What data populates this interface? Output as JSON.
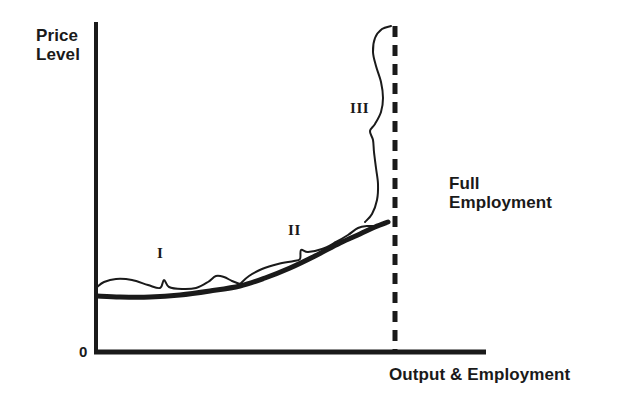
{
  "figure": {
    "type": "economics-diagram",
    "name": "Aggregate Supply Curve with Keynesian, Intermediate and Classical Ranges",
    "background_color": "#ffffff",
    "ink_color": "#1a1a1a"
  },
  "axes": {
    "y_title": "Price\nLevel",
    "x_title": "Output & Employment",
    "origin_label": "0",
    "y_axis": {
      "x": 96,
      "top": 22,
      "bottom": 352,
      "width": 4
    },
    "x_axis": {
      "y": 352,
      "left": 96,
      "right": 486,
      "width": 5
    }
  },
  "annotations": {
    "full_employment": "Full\nEmployment",
    "range_1": "I",
    "range_2": "II",
    "range_3": "III"
  },
  "curves": {
    "aggregate_supply": {
      "label": "aggregate-supply-curve",
      "stroke_width": 5,
      "points": [
        [
          97,
          296
        ],
        [
          120,
          297
        ],
        [
          150,
          297
        ],
        [
          180,
          295
        ],
        [
          210,
          291
        ],
        [
          240,
          286
        ],
        [
          265,
          278
        ],
        [
          290,
          268
        ],
        [
          315,
          256
        ],
        [
          340,
          243
        ],
        [
          360,
          234
        ],
        [
          375,
          227
        ],
        [
          388,
          222
        ]
      ]
    },
    "brace_range_1": {
      "label": "brace-range-1",
      "stroke_width": 2,
      "points": [
        [
          97,
          287
        ],
        [
          104,
          282
        ],
        [
          116,
          279
        ],
        [
          132,
          280
        ],
        [
          148,
          285
        ],
        [
          160,
          288
        ],
        [
          164,
          280
        ],
        [
          169,
          287
        ],
        [
          182,
          289
        ],
        [
          196,
          288
        ],
        [
          208,
          282
        ],
        [
          216,
          276
        ],
        [
          224,
          277
        ],
        [
          232,
          281
        ],
        [
          240,
          284
        ]
      ]
    },
    "brace_range_2": {
      "label": "brace-range-2",
      "stroke_width": 2,
      "points": [
        [
          240,
          284
        ],
        [
          249,
          276
        ],
        [
          262,
          269
        ],
        [
          278,
          264
        ],
        [
          294,
          261
        ],
        [
          300,
          259
        ],
        [
          301,
          250
        ],
        [
          308,
          252
        ],
        [
          322,
          249
        ],
        [
          336,
          242
        ],
        [
          348,
          235
        ],
        [
          358,
          228
        ],
        [
          368,
          226
        ],
        [
          378,
          226
        ],
        [
          388,
          222
        ]
      ]
    },
    "brace_range_3": {
      "label": "brace-range-3",
      "stroke_width": 2,
      "points": [
        [
          365,
          222
        ],
        [
          372,
          214
        ],
        [
          377,
          200
        ],
        [
          378,
          184
        ],
        [
          376,
          168
        ],
        [
          374,
          152
        ],
        [
          373,
          140
        ],
        [
          370,
          131
        ],
        [
          375,
          124
        ],
        [
          381,
          112
        ],
        [
          383,
          98
        ],
        [
          381,
          82
        ],
        [
          376,
          66
        ],
        [
          373,
          52
        ],
        [
          375,
          38
        ],
        [
          382,
          29
        ],
        [
          391,
          26
        ]
      ]
    }
  },
  "full_employment_line": {
    "label": "full-employment-dashed-line",
    "x": 395,
    "top": 26,
    "bottom": 352,
    "stroke_width": 5,
    "dash": "11 8"
  },
  "chart_data": {
    "type": "line",
    "xlabel": "Output & Employment",
    "ylabel": "Price Level",
    "grid": false,
    "legend": false,
    "annotations": [
      "I",
      "II",
      "III",
      "Full Employment",
      "0"
    ],
    "series": [
      {
        "name": "Aggregate Supply",
        "x": [
          0,
          10,
          23,
          36,
          49,
          62,
          72,
          83,
          94,
          105,
          113,
          120,
          125
        ],
        "y": [
          18,
          17,
          17,
          18,
          20,
          22,
          25,
          29,
          34,
          39,
          43,
          46,
          48
        ]
      }
    ],
    "vertical_reference": {
      "name": "Full Employment",
      "x": 128
    },
    "ranges": [
      {
        "name": "I",
        "description": "Keynesian (horizontal) range",
        "x_from": 0,
        "x_to": 62
      },
      {
        "name": "II",
        "description": "Intermediate (upsloping) range",
        "x_from": 62,
        "x_to": 125
      },
      {
        "name": "III",
        "description": "Classical (vertical) range",
        "x_from": 125,
        "x_to": 128
      }
    ],
    "xlim": [
      0,
      170
    ],
    "ylim": [
      0,
      145
    ]
  }
}
